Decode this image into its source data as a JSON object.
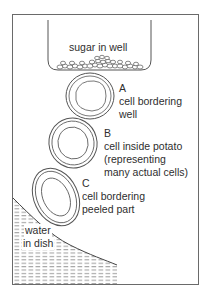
{
  "diagram": {
    "well_label": "sugar in well",
    "cells": [
      {
        "letter": "A",
        "lines": [
          "cell bordering",
          "well"
        ]
      },
      {
        "letter": "B",
        "lines": [
          "cell inside potato",
          "(representing",
          "many actual cells)"
        ]
      },
      {
        "letter": "C",
        "lines": [
          "cell bordering",
          "peeled part"
        ]
      }
    ],
    "water_label": [
      "water",
      "in dish"
    ],
    "colors": {
      "line": "#555555",
      "frame": "#6a6a6a",
      "background": "#ffffff"
    }
  }
}
